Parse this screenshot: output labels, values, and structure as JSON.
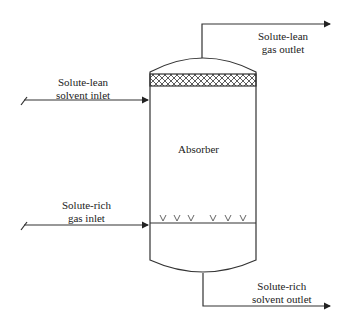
{
  "diagram": {
    "type": "process-flow",
    "vessel": {
      "label": "Absorber"
    },
    "streams": [
      {
        "id": "solvent-in",
        "line1": "Solute-lean",
        "line2": "solvent inlet"
      },
      {
        "id": "gas-out",
        "line1": "Solute-lean",
        "line2": "gas outlet"
      },
      {
        "id": "gas-in",
        "line1": "Solute-rich",
        "line2": "gas inlet"
      },
      {
        "id": "solvent-out",
        "line1": "Solute-rich",
        "line2": "solvent outlet"
      }
    ],
    "colors": {
      "line": "#333333",
      "background": "#ffffff"
    }
  }
}
